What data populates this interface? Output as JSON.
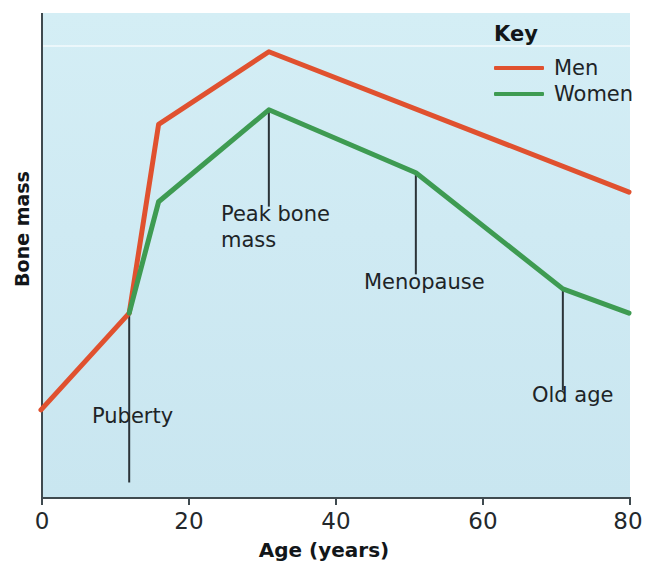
{
  "chart_data": {
    "type": "line",
    "title": "",
    "xlabel": "Age (years)",
    "ylabel": "Bone mass",
    "xlim": [
      0,
      80
    ],
    "ylim": [
      0,
      100
    ],
    "xticks": [
      0,
      20,
      40,
      60,
      80
    ],
    "xtick_labels": [
      "0",
      "20",
      "40",
      "60",
      "80"
    ],
    "yticks": [],
    "ytick_labels": [],
    "grid": false,
    "legend_position": "top-right",
    "legend_title": "Key",
    "background_color": "#cfeaf3",
    "series": [
      {
        "name": "Men",
        "color": "#e0512f",
        "x": [
          0,
          12,
          16,
          31,
          80
        ],
        "y": [
          18,
          38,
          77,
          92,
          63
        ]
      },
      {
        "name": "Women",
        "color": "#3e9b52",
        "x": [
          12,
          16,
          31,
          51,
          71,
          80
        ],
        "y": [
          38,
          61,
          80,
          67,
          43,
          38
        ]
      }
    ],
    "annotations": [
      {
        "text": "Puberty",
        "x": 12,
        "y": 38,
        "label_x": 12,
        "label_y": 3
      },
      {
        "text": "Peak bone\nmass",
        "x": 31,
        "y": 80,
        "label_x": 31,
        "label_y": 60
      },
      {
        "text": "Menopause",
        "x": 51,
        "y": 67,
        "label_x": 51,
        "label_y": 46
      },
      {
        "text": "Old age",
        "x": 71,
        "y": 43,
        "label_x": 71,
        "label_y": 22
      }
    ]
  },
  "axis": {
    "x_title": "Age (years)",
    "y_title": "Bone mass",
    "x_tick_labels": [
      "0",
      "20",
      "40",
      "60",
      "80"
    ]
  },
  "legend": {
    "title": "Key",
    "items": [
      {
        "label": "Men",
        "color": "#e0512f"
      },
      {
        "label": "Women",
        "color": "#3e9b52"
      }
    ]
  },
  "annotations": [
    {
      "text": "Puberty"
    },
    {
      "text": "Peak bone\nmass"
    },
    {
      "text": "Menopause"
    },
    {
      "text": "Old age"
    }
  ]
}
